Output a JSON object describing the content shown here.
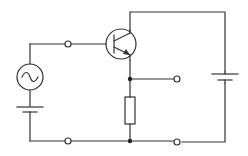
{
  "diagram": {
    "type": "circuit-schematic",
    "colors": {
      "line": "#333333",
      "background": "#ffffff",
      "junction": "#222222"
    },
    "components": [
      {
        "id": "ac-source",
        "kind": "AC voltage source",
        "symbol": "~"
      },
      {
        "id": "bias-battery",
        "kind": "DC battery (base bias)"
      },
      {
        "id": "transistor",
        "kind": "NPN bipolar transistor"
      },
      {
        "id": "emitter-resistor",
        "kind": "resistor"
      },
      {
        "id": "supply-battery",
        "kind": "DC battery (collector supply)"
      },
      {
        "id": "input-terminals",
        "kind": "terminal pair",
        "count": 2
      },
      {
        "id": "output-terminals",
        "kind": "terminal pair",
        "count": 2
      }
    ],
    "junctions": 2,
    "terminals": 4
  }
}
